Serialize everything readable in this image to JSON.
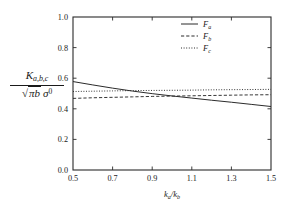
{
  "chart_data": {
    "type": "line",
    "title": "",
    "subtitle": "",
    "xlabel": "k_a/k_b",
    "ylabel": "K_{a,b,c} / sqrt(pi b) sigma^0",
    "xlim": [
      0.5,
      1.5
    ],
    "ylim": [
      0.0,
      1.0
    ],
    "grid": false,
    "legend_position": "top-right-inside",
    "xticks": [
      0.5,
      0.7,
      0.9,
      1.1,
      1.3,
      1.5
    ],
    "xtick_labels": [
      "0.5",
      "0.7",
      "0.9",
      "1.1",
      "1.3",
      "1.5"
    ],
    "yticks": [
      0.0,
      0.2,
      0.4,
      0.6,
      0.8,
      1.0
    ],
    "ytick_labels": [
      "0.0",
      "0.2",
      "0.4",
      "0.6",
      "0.8",
      "1.0"
    ],
    "x": [
      0.5,
      0.6,
      0.7,
      0.8,
      0.9,
      1.0,
      1.1,
      1.2,
      1.3,
      1.4,
      1.5
    ],
    "series": [
      {
        "name": "F_a",
        "legend_label": "Fa",
        "style": "solid",
        "color": "#2b2b2b",
        "values": [
          0.578,
          0.556,
          0.535,
          0.516,
          0.499,
          0.484,
          0.47,
          0.456,
          0.443,
          0.429,
          0.415
        ]
      },
      {
        "name": "F_b",
        "legend_label": "Fb",
        "style": "dashed",
        "color": "#2b2b2b",
        "values": [
          0.468,
          0.472,
          0.475,
          0.478,
          0.481,
          0.483,
          0.485,
          0.487,
          0.489,
          0.491,
          0.492
        ]
      },
      {
        "name": "F_c",
        "legend_label": "Fc",
        "style": "dotted",
        "color": "#2b2b2b",
        "values": [
          0.513,
          0.515,
          0.517,
          0.519,
          0.52,
          0.521,
          0.522,
          0.524,
          0.525,
          0.526,
          0.527
        ]
      }
    ]
  },
  "axes": {
    "y_label_numerator": "K",
    "y_label_numerator_sub": "a,b,c",
    "y_label_denominator_radical": "√",
    "y_label_denominator_pi": "πb",
    "y_label_denominator_sigma": "σ",
    "y_label_denominator_sup": "0",
    "x_label_k": "k",
    "x_label_sub_a": "a",
    "x_label_slash": "/",
    "x_label_k2": "k",
    "x_label_sub_b": "b"
  },
  "legend": {
    "items": [
      {
        "symbol": "F",
        "sub": "a",
        "style": "solid"
      },
      {
        "symbol": "F",
        "sub": "b",
        "style": "dashed"
      },
      {
        "symbol": "F",
        "sub": "c",
        "style": "dotted"
      }
    ]
  }
}
